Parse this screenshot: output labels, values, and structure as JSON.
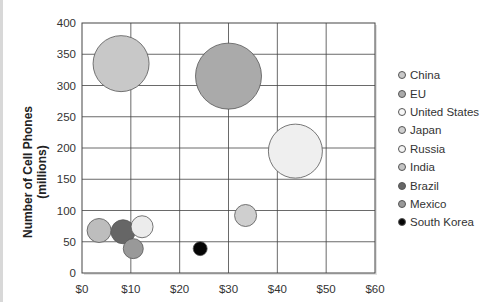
{
  "chart_data": {
    "type": "bubble",
    "title": "",
    "xlabel": "",
    "ylabel": "Number of Cell Phones (millions)",
    "xlim": [
      0,
      60
    ],
    "ylim": [
      0,
      400
    ],
    "x_ticks": [
      "$0",
      "$10",
      "$20",
      "$30",
      "$40",
      "$50",
      "$60"
    ],
    "y_ticks": [
      "0",
      "50",
      "100",
      "150",
      "200",
      "250",
      "300",
      "350",
      "400"
    ],
    "grid": true,
    "legend_position": "right",
    "series": [
      {
        "name": "China",
        "x": 8,
        "y": 335,
        "size": 28,
        "color": "#c8c8c8"
      },
      {
        "name": "EU",
        "x": 30,
        "y": 315,
        "size": 33,
        "color": "#aaaaaa"
      },
      {
        "name": "United States",
        "x": 43.7,
        "y": 195,
        "size": 27,
        "color": "#efefef"
      },
      {
        "name": "Japan",
        "x": 33.5,
        "y": 92,
        "size": 11,
        "color": "#cfcfcf"
      },
      {
        "name": "Russia",
        "x": 12.3,
        "y": 74,
        "size": 11,
        "color": "#ececec"
      },
      {
        "name": "India",
        "x": 3.5,
        "y": 68,
        "size": 12,
        "color": "#bdbdbd"
      },
      {
        "name": "Brazil",
        "x": 8.4,
        "y": 66,
        "size": 12,
        "color": "#666666"
      },
      {
        "name": "Mexico",
        "x": 10.5,
        "y": 39,
        "size": 10,
        "color": "#999999"
      },
      {
        "name": "South Korea",
        "x": 24.2,
        "y": 39,
        "size": 7,
        "color": "#050505"
      }
    ]
  },
  "legend": [
    {
      "label": "China",
      "color": "#c8c8c8"
    },
    {
      "label": "EU",
      "color": "#aaaaaa"
    },
    {
      "label": "United States",
      "color": "#f7f7f7"
    },
    {
      "label": "Japan",
      "color": "#cfcfcf"
    },
    {
      "label": "Russia",
      "color": "#f4f4f4"
    },
    {
      "label": "India",
      "color": "#c4c4c4"
    },
    {
      "label": "Brazil",
      "color": "#666666"
    },
    {
      "label": "Mexico",
      "color": "#999999"
    },
    {
      "label": "South Korea",
      "color": "#050505"
    }
  ]
}
